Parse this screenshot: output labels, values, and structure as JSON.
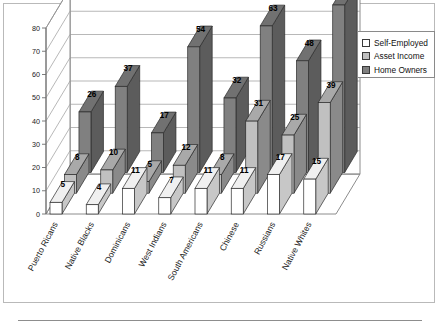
{
  "chart_data": {
    "type": "bar",
    "title": "",
    "subtitle": "",
    "xlabel": "",
    "ylabel": "",
    "ylim": [
      0,
      80
    ],
    "yticks": [
      0,
      10,
      20,
      30,
      40,
      50,
      60,
      70,
      80
    ],
    "ytick_labels": [
      "0",
      "10",
      "20",
      "30",
      "40",
      "50",
      "60",
      "70",
      "80"
    ],
    "grid": true,
    "threed": true,
    "legend_position": "top-right",
    "categories": [
      "Puerto Ricans",
      "Native Blacks",
      "Dominicans",
      "West Indians",
      "South Americans",
      "Chinese",
      "Russians",
      "Native Whites"
    ],
    "series": [
      {
        "name": "Self-Employed",
        "color": "#ffffff",
        "values": [
          5,
          4,
          11,
          7,
          11,
          11,
          17,
          15
        ]
      },
      {
        "name": "Asset Income",
        "color": "#c0c0c0",
        "values": [
          8,
          10,
          5,
          12,
          8,
          31,
          25,
          39
        ]
      },
      {
        "name": "Home Owners",
        "color": "#808080",
        "values": [
          26,
          37,
          17,
          54,
          32,
          63,
          48,
          72
        ]
      }
    ]
  },
  "legend": {
    "items": [
      {
        "label": "Self-Employed",
        "color": "#ffffff"
      },
      {
        "label": "Asset Income",
        "color": "#c0c0c0"
      },
      {
        "label": "Home Owners",
        "color": "#808080"
      }
    ]
  },
  "colors": {
    "self_employed": "#ffffff",
    "asset_income": "#c0c0c0",
    "home_owners": "#808080",
    "grid": "#9a9a9a",
    "axis": "#6e6e6e",
    "edge": "#2b2b2b",
    "frame": "#b9b9b9"
  }
}
